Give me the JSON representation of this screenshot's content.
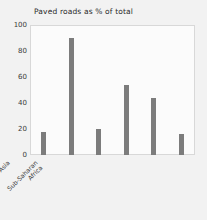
{
  "chart_data": {
    "type": "bar",
    "title": "Paved roads as % of total",
    "xlabel": "",
    "ylabel": "",
    "ylim": [
      0,
      100
    ],
    "yticks": [
      0,
      20,
      40,
      60,
      80,
      100
    ],
    "grid": false,
    "legend": null,
    "bar_color": "#7c7c7c",
    "background_color": "#f2f2f2",
    "plot_background_color": "#fbfbfb",
    "categories": [
      "East Asia & Pacific",
      "Europe & Central Asia",
      "Latin America & Caribbean",
      "Middle East & North Africa",
      "South Asia",
      "Sub-Saharan Africa"
    ],
    "category_lines": [
      [
        "East Asia",
        "& Pacific"
      ],
      [
        "Europe &",
        "Central Asia"
      ],
      [
        "Latin America",
        "& Caribbean"
      ],
      [
        "Middle East",
        "& North Africa"
      ],
      [
        "South Asia"
      ],
      [
        "Sub-Saharan",
        "Africa"
      ]
    ],
    "values": [
      18,
      90,
      20,
      54,
      44,
      16
    ]
  }
}
